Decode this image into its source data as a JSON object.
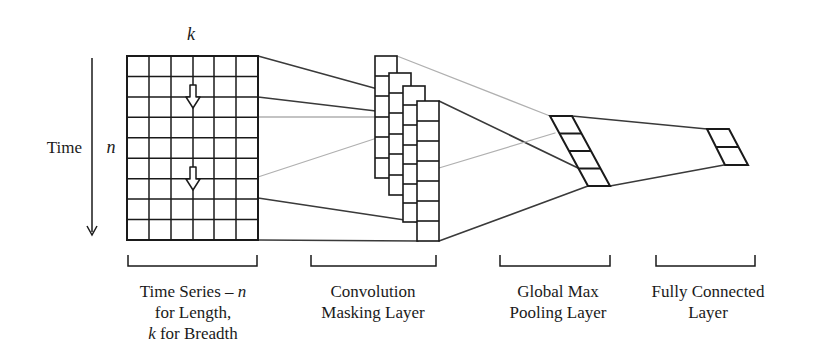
{
  "diagram": {
    "type": "cnn-architecture",
    "axis_labels": {
      "time": "Time",
      "n": "n",
      "k": "k"
    },
    "input_grid": {
      "columns": 6,
      "rows": 9
    },
    "layers": [
      {
        "id": "time-series",
        "caption_lines": [
          "Time Series – n",
          "for Length,",
          "k for Breadth"
        ]
      },
      {
        "id": "convolution",
        "caption_lines": [
          "Convolution",
          "Masking Layer"
        ]
      },
      {
        "id": "global-max-pooling",
        "caption_lines": [
          "Global Max",
          "Pooling Layer"
        ]
      },
      {
        "id": "fully-connected",
        "caption_lines": [
          "Fully Connected",
          "Layer"
        ]
      }
    ],
    "time_series_caption": {
      "line1_text": "Time Series – ",
      "line1_var": "n",
      "line2": "for Length,",
      "line3_var": "k",
      "line3_text": " for Breadth"
    },
    "colors": {
      "stroke": "#1a1a1a",
      "light_line": "#a8a8a8",
      "background": "#ffffff"
    }
  }
}
